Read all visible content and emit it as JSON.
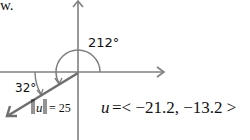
{
  "caption_fragment": "w.",
  "diagram": {
    "angle_label": "212°",
    "reference_angle_label": "32°",
    "magnitude_label": "‖u‖ = 25",
    "magnitude_var": "u",
    "magnitude_value": "= 25",
    "component_form": {
      "var": "u",
      "text": "=< −21.2, −13.2 >",
      "x": "-21.2",
      "y": "-13.2"
    },
    "vector": {
      "magnitude": 25,
      "direction_deg": 212
    },
    "colors": {
      "axes": "#7f7f7f",
      "vector": "#6f6f6f",
      "text": "#111111"
    }
  }
}
